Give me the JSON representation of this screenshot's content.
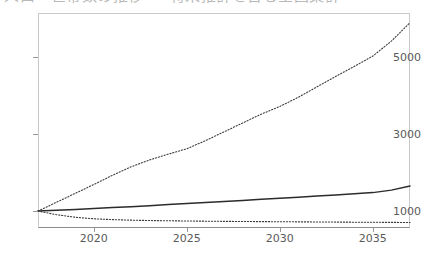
{
  "figure": {
    "title_clipped": "人口・世帯数の推移 ― 将来推計を含む全国集計",
    "background_color": "#ffffff",
    "frame_color": "#c9c9c9",
    "axis_color": "#8c8c8c",
    "tick_text_color": "#5a5a5a"
  },
  "chart_data": {
    "type": "line",
    "title": "人口・世帯数の推移 ― 将来推計を含む全国集計",
    "xlabel": "",
    "ylabel": "",
    "xlim": [
      2017,
      2037
    ],
    "ylim": [
      560,
      6150
    ],
    "grid": false,
    "legend": "none",
    "xticks": [
      2020,
      2025,
      2030,
      2035
    ],
    "xtick_labels": [
      "2020",
      "2025",
      "2030",
      "2035"
    ],
    "yticks": [
      1000,
      3000,
      5000
    ],
    "ytick_labels": [
      "1000",
      "3000",
      "5000"
    ],
    "x": [
      2017,
      2018,
      2019,
      2020,
      2021,
      2022,
      2023,
      2024,
      2025,
      2026,
      2027,
      2028,
      2029,
      2030,
      2031,
      2032,
      2033,
      2034,
      2035,
      2036,
      2037
    ],
    "series": [
      {
        "name": "upper-dotted-series",
        "style": "dotted",
        "color": "#3c3c3c",
        "values": [
          1000,
          1230,
          1460,
          1690,
          1930,
          2150,
          2330,
          2480,
          2620,
          2830,
          3060,
          3290,
          3520,
          3720,
          3960,
          4230,
          4500,
          4760,
          5030,
          5420,
          5900
        ]
      },
      {
        "name": "middle-solid-series",
        "style": "solid",
        "color": "#2b2b2b",
        "values": [
          1000,
          1020,
          1042,
          1065,
          1090,
          1112,
          1138,
          1170,
          1196,
          1222,
          1250,
          1278,
          1308,
          1336,
          1362,
          1390,
          1418,
          1448,
          1480,
          1545,
          1650
        ]
      },
      {
        "name": "lower-dotted-series",
        "style": "dotted",
        "color": "#3c3c3c",
        "values": [
          1000,
          905,
          840,
          800,
          778,
          764,
          754,
          748,
          742,
          737,
          733,
          729,
          726,
          723,
          720,
          717,
          714,
          711,
          709,
          706,
          703
        ]
      }
    ]
  }
}
